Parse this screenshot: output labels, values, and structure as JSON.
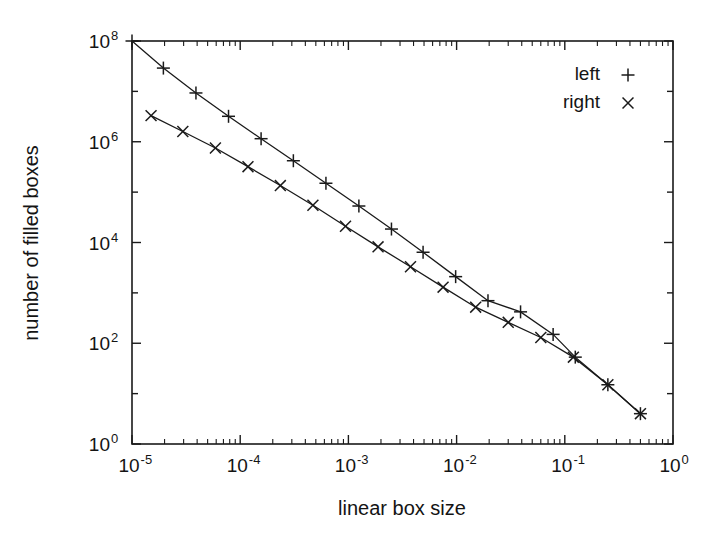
{
  "figure": {
    "background_color": "#ffffff",
    "line_color": "#1a1a1a",
    "plot_frame": {
      "left": 132,
      "top": 41,
      "right": 673,
      "bottom": 444
    }
  },
  "chart_data": {
    "type": "line",
    "title": "",
    "subtitle": "",
    "xlabel": "linear box size",
    "ylabel": "number of filled boxes",
    "xscale": "log",
    "yscale": "log",
    "xlim": [
      1e-05,
      1
    ],
    "ylim": [
      1,
      100000000.0
    ],
    "grid": false,
    "legend_position": "top-right",
    "xticks": [
      1e-05,
      0.0001,
      0.001,
      0.01,
      0.1,
      1
    ],
    "xtick_labels": [
      "10-5",
      "10-4",
      "10-3",
      "10-2",
      "10-1",
      "10 0"
    ],
    "xtick_mantissas": [
      "10",
      "10",
      "10",
      "10",
      "10",
      "10"
    ],
    "xtick_exponents": [
      "-5",
      "-4",
      "-3",
      "-2",
      "-1",
      "0"
    ],
    "yticks": [
      1,
      100,
      10000,
      1000000,
      100000000
    ],
    "ytick_mantissas": [
      "10",
      "10",
      "10",
      "10",
      "10"
    ],
    "ytick_exponents": [
      "0",
      "2",
      "4",
      "6",
      "8"
    ],
    "minor_ticks": true,
    "series": [
      {
        "name": "left",
        "marker": "+",
        "marker_symbol": "plus-marker",
        "color": "#1a1a1a",
        "x": [
          1e-05,
          1.95e-05,
          3.9e-05,
          7.8e-05,
          0.000156,
          0.00031,
          0.00062,
          0.00125,
          0.0025,
          0.0049,
          0.0098,
          0.0195,
          0.039,
          0.078,
          0.125,
          0.25,
          0.5
        ],
        "y": [
          100000000.0,
          29000000.0,
          9300000.0,
          3200000.0,
          1150000.0,
          420000.0,
          150000.0,
          53000.0,
          18500.0,
          6400,
          2100,
          700,
          420,
          150,
          53,
          15,
          4
        ]
      },
      {
        "name": "right",
        "marker": "x",
        "marker_symbol": "cross-marker",
        "color": "#1a1a1a",
        "x": [
          1.5e-05,
          2.95e-05,
          5.9e-05,
          0.000118,
          0.000235,
          0.00047,
          0.00094,
          0.00188,
          0.00375,
          0.0075,
          0.015,
          0.03,
          0.06,
          0.12,
          0.25,
          0.5
        ],
        "y": [
          3300000.0,
          1600000.0,
          750000.0,
          320000.0,
          135000.0,
          55000.0,
          21000.0,
          8200,
          3300,
          1300,
          520,
          260,
          130,
          53,
          15,
          4
        ]
      }
    ]
  },
  "legend": {
    "entries": [
      {
        "label": "left",
        "symbol": "+"
      },
      {
        "label": "right",
        "symbol": "×"
      }
    ]
  },
  "axis_titles": {
    "x": "linear box size",
    "y": "number of filled boxes"
  }
}
